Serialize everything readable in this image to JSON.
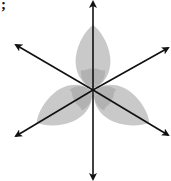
{
  "fragment_text": ";",
  "diagram": {
    "petal_count": 3,
    "lines_of_symmetry": 3,
    "arrow_count": 6,
    "center": [
      93,
      90
    ],
    "colors": {
      "petal_fill": "#c9c9c9",
      "petal_inner": "#b2b2b2",
      "axis": "#111111"
    }
  }
}
